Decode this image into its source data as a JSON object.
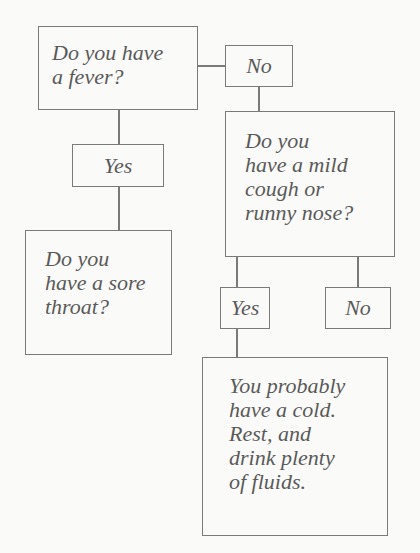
{
  "diagram": {
    "type": "flowchart",
    "colors": {
      "background": "#fafaf9",
      "line": "#7a7a7a",
      "text": "#5a5a5a"
    },
    "nodes": {
      "fever": {
        "text": "Do you have\na fever?"
      },
      "fever_no": {
        "text": "No"
      },
      "fever_yes": {
        "text": "Yes"
      },
      "sore_throat": {
        "text": "Do you\nhave a sore\nthroat?"
      },
      "cough": {
        "text": "Do you\nhave a mild\ncough or\nrunny nose?"
      },
      "cough_yes": {
        "text": "Yes"
      },
      "cough_no": {
        "text": "No"
      },
      "cold": {
        "text": "You probably\nhave a cold.\nRest, and\ndrink plenty\nof fluids."
      }
    },
    "edges": [
      {
        "from": "fever",
        "to": "fever_no"
      },
      {
        "from": "fever",
        "to": "fever_yes"
      },
      {
        "from": "fever_yes",
        "to": "sore_throat"
      },
      {
        "from": "fever_no",
        "to": "cough"
      },
      {
        "from": "cough",
        "to": "cough_yes"
      },
      {
        "from": "cough",
        "to": "cough_no"
      },
      {
        "from": "cough_yes",
        "to": "cold"
      }
    ]
  }
}
